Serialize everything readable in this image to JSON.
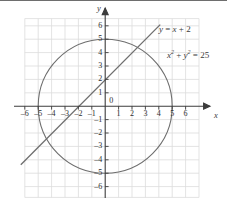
{
  "figure": {
    "title": "",
    "axis_names": {
      "x": "x",
      "y": "y"
    },
    "annotations": {
      "line_equation": "y = x + 2",
      "circle_equation": "x2 + y2 = 25"
    }
  },
  "colors": {
    "grid": "#dcdcdc",
    "axis": "#3c3c3c",
    "curve": "#6e6e6e",
    "text": "#2e2e2e",
    "background": "#ffffff"
  },
  "chart_data": {
    "type": "line",
    "title": "",
    "xlabel": "x",
    "ylabel": "y",
    "xlim": [
      -6.5,
      6.5
    ],
    "ylim": [
      -6.5,
      6.5
    ],
    "grid": true,
    "legend": "none",
    "xticks": [
      -6,
      -5,
      -4,
      -3,
      -2,
      -1,
      0,
      1,
      2,
      3,
      4,
      5,
      6
    ],
    "yticks": [
      -6,
      -5,
      -4,
      -3,
      -2,
      -1,
      0,
      1,
      2,
      3,
      4,
      5,
      6
    ],
    "xtick_labels": [
      "–6",
      "–5",
      "–4",
      "–3",
      "–2",
      "–1",
      "0",
      "1",
      "2",
      "3",
      "4",
      "5",
      "6"
    ],
    "ytick_labels": [
      "–6",
      "–5",
      "–4",
      "–3",
      "–2",
      "–1",
      "0",
      "1",
      "2",
      "3",
      "4",
      "5",
      "6"
    ],
    "series": [
      {
        "name": "y = x + 2",
        "kind": "line",
        "equation": "y = x + 2",
        "slope": 1,
        "intercept": 2,
        "x_start": -6.3,
        "x_end": 4.1,
        "y_start": -4.3,
        "y_end": 6.1,
        "label": "y = x + 2"
      },
      {
        "name": "x2 + y2 = 25",
        "kind": "circle",
        "equation": "x^2 + y^2 = 25",
        "center": [
          0,
          0
        ],
        "radius": 5,
        "label": "x2 + y2 = 25"
      }
    ],
    "intersections": [
      [
        -4,
        -2
      ],
      [
        3,
        5
      ]
    ]
  }
}
